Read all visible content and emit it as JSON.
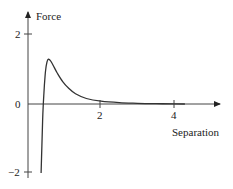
{
  "chart_data": {
    "type": "line",
    "title": "",
    "xlabel": "Separation",
    "ylabel": "Force",
    "xlim": [
      0,
      5.3
    ],
    "ylim": [
      -2,
      2.3
    ],
    "x_ticks": [
      2,
      4
    ],
    "x_tick_labels": [
      "2",
      "4"
    ],
    "y_ticks": [
      -2,
      0,
      2
    ],
    "y_tick_labels": [
      "−2",
      "0",
      "2"
    ],
    "grid": false,
    "legend": null,
    "series": [
      {
        "name": "Force vs Separation",
        "x": [
          0.36,
          0.38,
          0.4,
          0.42,
          0.45,
          0.48,
          0.52,
          0.56,
          0.62,
          0.7,
          0.8,
          0.95,
          1.1,
          1.3,
          1.6,
          2.0,
          2.5,
          3.0,
          3.5,
          4.0,
          4.3
        ],
        "y": [
          -2.0,
          -1.2,
          -0.5,
          0.0,
          0.55,
          0.95,
          1.22,
          1.3,
          1.25,
          1.1,
          0.9,
          0.65,
          0.47,
          0.3,
          0.16,
          0.08,
          0.04,
          0.02,
          0.01,
          0.005,
          0.0
        ]
      }
    ]
  }
}
